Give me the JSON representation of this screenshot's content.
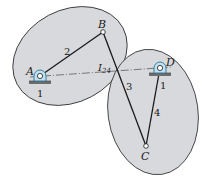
{
  "diagram": {
    "type": "four-bar linkage with instant center",
    "colors": {
      "body_fill": "#d8d9dc",
      "body_stroke": "#2a2a2a",
      "link": "#1a1a1a",
      "pivot": "#3a7fa0",
      "ground": "#6d6d6d"
    },
    "points": {
      "A": {
        "label": "A",
        "x": 40,
        "y": 76
      },
      "B": {
        "label": "B",
        "x": 103,
        "y": 32
      },
      "C": {
        "label": "C",
        "x": 146,
        "y": 146
      },
      "D": {
        "label": "D",
        "x": 160,
        "y": 68
      },
      "I24": {
        "label": "I",
        "sub": "24",
        "x": 117,
        "y": 72
      }
    },
    "link_labels": {
      "ground_A": "1",
      "ground_D": "1",
      "link_AB": "2",
      "link_BC": "3",
      "link_CD": "4"
    }
  }
}
